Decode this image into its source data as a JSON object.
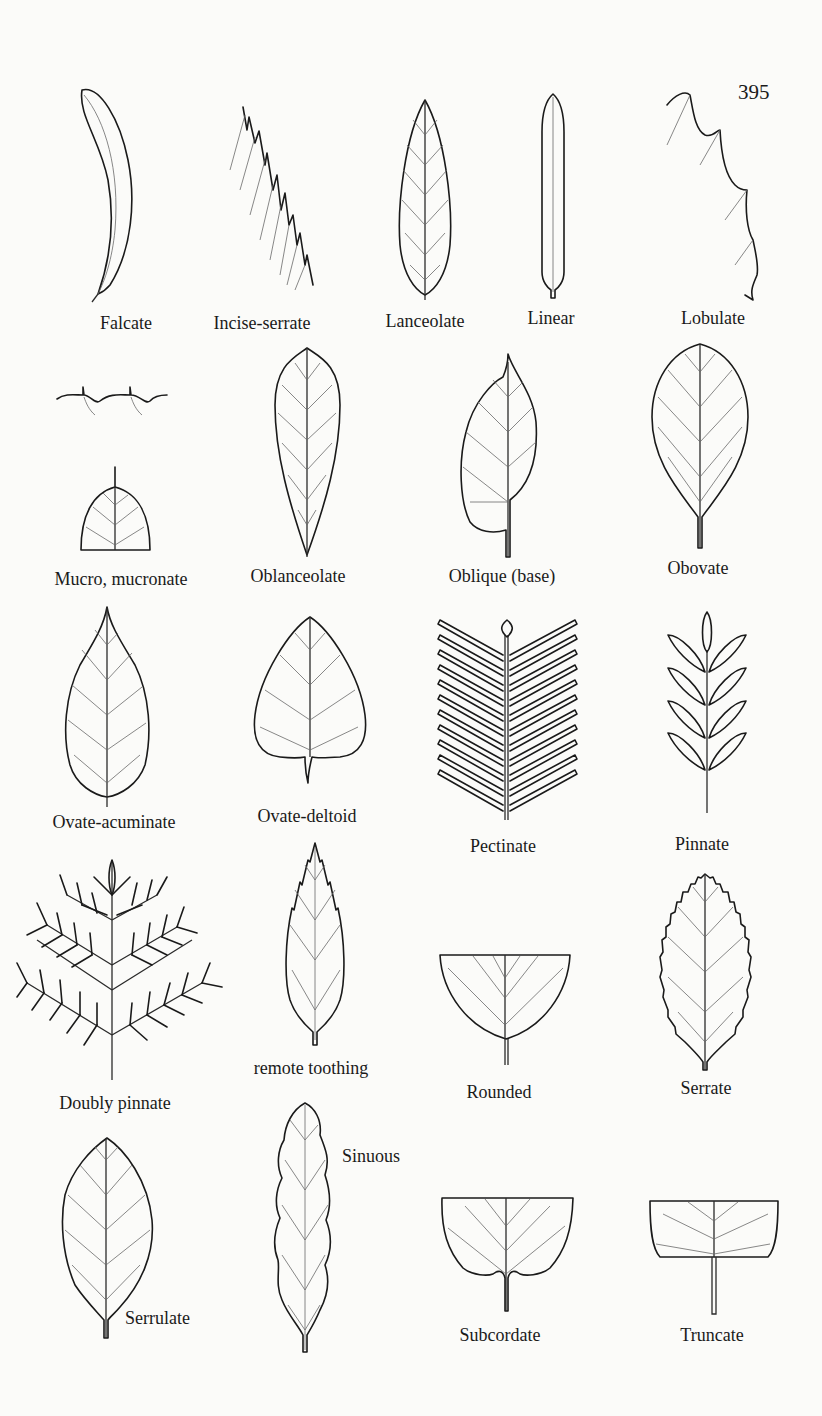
{
  "page": {
    "page_number": "395",
    "content_type": "botanical glossary plate of leaf shapes and margins"
  },
  "figures": [
    {
      "id": "falcate",
      "label": "Falcate"
    },
    {
      "id": "incise-serrate",
      "label": "Incise-serrate"
    },
    {
      "id": "lanceolate",
      "label": "Lanceolate"
    },
    {
      "id": "linear",
      "label": "Linear"
    },
    {
      "id": "lobulate",
      "label": "Lobulate"
    },
    {
      "id": "mucronate",
      "label": "Mucro, mucronate"
    },
    {
      "id": "oblanceolate",
      "label": "Oblanceolate"
    },
    {
      "id": "oblique-base",
      "label": "Oblique (base)"
    },
    {
      "id": "obovate",
      "label": "Obovate"
    },
    {
      "id": "ovate-acuminate",
      "label": "Ovate-acuminate"
    },
    {
      "id": "ovate-deltoid",
      "label": "Ovate-deltoid"
    },
    {
      "id": "pectinate",
      "label": "Pectinate"
    },
    {
      "id": "pinnate",
      "label": "Pinnate"
    },
    {
      "id": "doubly-pinnate",
      "label": "Doubly pinnate"
    },
    {
      "id": "remote-toothing",
      "label": "remote toothing"
    },
    {
      "id": "rounded",
      "label": "Rounded"
    },
    {
      "id": "serrate",
      "label": "Serrate"
    },
    {
      "id": "serrulate",
      "label": "Serrulate"
    },
    {
      "id": "sinuous",
      "label": "Sinuous"
    },
    {
      "id": "subcordate",
      "label": "Subcordate"
    },
    {
      "id": "truncate",
      "label": "Truncate"
    }
  ]
}
